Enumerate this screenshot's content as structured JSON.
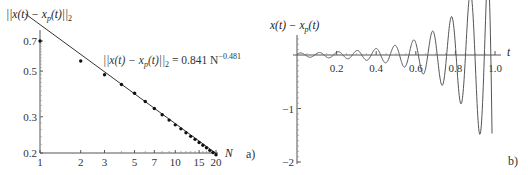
{
  "chart_data": [
    {
      "type": "scatter",
      "panel": "a)",
      "title": "",
      "ylabel": "||x(t) - x_p(t)||_2",
      "xlabel": "N",
      "xscale": "log",
      "yscale": "log",
      "xlim": [
        1,
        20
      ],
      "ylim": [
        0.2,
        0.75
      ],
      "x_ticks": [
        1,
        2,
        3,
        5,
        7,
        10,
        15,
        20
      ],
      "y_ticks": [
        0.2,
        0.3,
        0.5,
        0.7
      ],
      "grid": false,
      "series": [
        {
          "name": "error norm",
          "kind": "points",
          "x": [
            1,
            2,
            3,
            4,
            5,
            6,
            7,
            8,
            9,
            10,
            11,
            12,
            13,
            14,
            15,
            16,
            17,
            18,
            19,
            20
          ],
          "values": [
            0.7,
            0.56,
            0.48,
            0.43,
            0.39,
            0.356,
            0.329,
            0.307,
            0.289,
            0.274,
            0.262,
            0.251,
            0.241,
            0.233,
            0.225,
            0.218,
            0.212,
            0.206,
            0.201,
            0.196
          ]
        },
        {
          "name": "fit",
          "kind": "line",
          "formula": "0.841 N^-0.481",
          "coef": 0.841,
          "exponent": -0.481
        }
      ],
      "annotations": [
        {
          "text_main": "||x(t) − x_p(t)||₂ = 0.841 N",
          "text_sup": "−0.481"
        }
      ]
    },
    {
      "type": "line",
      "panel": "b)",
      "title": "",
      "ylabel": "x(t) − x_p(t)",
      "xlabel": "t",
      "xlim": [
        0,
        1.0
      ],
      "ylim": [
        -2,
        0.5
      ],
      "x_ticks": [
        0.2,
        0.4,
        0.6,
        0.8,
        1.0
      ],
      "y_ticks": [
        -1,
        -2
      ],
      "grid": false,
      "series": [
        {
          "name": "x(t) - x_p(t)",
          "x": [
            0.0,
            0.05,
            0.1,
            0.15,
            0.2,
            0.25,
            0.3,
            0.35,
            0.4,
            0.45,
            0.5,
            0.55,
            0.6,
            0.65,
            0.7,
            0.75,
            0.8,
            0.85,
            0.9,
            0.95,
            0.97,
            0.99
          ],
          "values": [
            0.03,
            -0.03,
            0.03,
            -0.03,
            0.03,
            -0.03,
            0.03,
            -0.03,
            0.04,
            -0.04,
            0.05,
            -0.05,
            0.06,
            -0.07,
            0.09,
            -0.1,
            0.14,
            -0.18,
            0.25,
            0.32,
            -0.3,
            -2.0
          ]
        }
      ]
    }
  ],
  "labels": {
    "a": {
      "ylabel": "||x(t) − x",
      "ylabel_sub": "p",
      "ylabel_end": "(t)||",
      "ylabel_norm_sub": "2",
      "xlabel": "N",
      "panel": "a)",
      "annot_main": "||x(t) − x",
      "annot_sub": "p",
      "annot_mid": "(t)||",
      "annot_norm_sub": "2",
      "annot_rhs": " = 0.841 N",
      "annot_sup": "−0.481",
      "xticks": [
        "1",
        "2",
        "3",
        "5",
        "7",
        "10",
        "15",
        "20"
      ],
      "yticks": [
        "0.7",
        "0.5",
        "0.3",
        "0.2"
      ]
    },
    "b": {
      "ylabel": "x(t) − x",
      "ylabel_sub": "p",
      "ylabel_end": "(t)",
      "xlabel": "t",
      "panel": "b)",
      "xticks": [
        "0.2",
        "0.4",
        "0.6",
        "0.8",
        "1.0"
      ],
      "yticks": [
        "−1",
        "−2"
      ]
    }
  }
}
